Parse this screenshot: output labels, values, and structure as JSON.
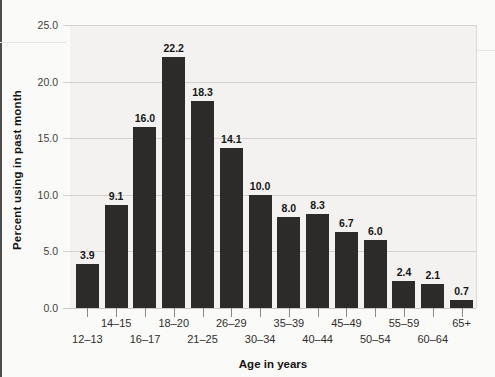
{
  "page": {
    "background": "#fafaf8",
    "plot_background": "#f3f2f0",
    "grid_color": "#d4d2cf",
    "bar_color": "#2d2b2a"
  },
  "chart_data": {
    "type": "bar",
    "title": "",
    "xlabel": "Age in years",
    "ylabel": "Percent using in past month",
    "categories": [
      "12–13",
      "14–15",
      "16–17",
      "18–20",
      "21–25",
      "26–29",
      "30–34",
      "35–39",
      "40–44",
      "45–49",
      "50–54",
      "55–59",
      "60–64",
      "65+"
    ],
    "values": [
      3.9,
      9.1,
      16.0,
      22.2,
      18.3,
      14.1,
      10.0,
      8.0,
      8.3,
      6.7,
      6.0,
      2.4,
      2.1,
      0.7
    ],
    "value_labels": [
      "3.9",
      "9.1",
      "16.0",
      "22.2",
      "18.3",
      "14.1",
      "10.0",
      "8.0",
      "8.3",
      "6.7",
      "6.0",
      "2.4",
      "2.1",
      "0.7"
    ],
    "y_ticks": [
      "25.0",
      "20.0",
      "15.0",
      "10.0",
      "5.0",
      "0.0"
    ],
    "ylim": [
      0,
      25
    ],
    "grid": true,
    "legend": "none",
    "bar_color": "#2d2b2a"
  }
}
